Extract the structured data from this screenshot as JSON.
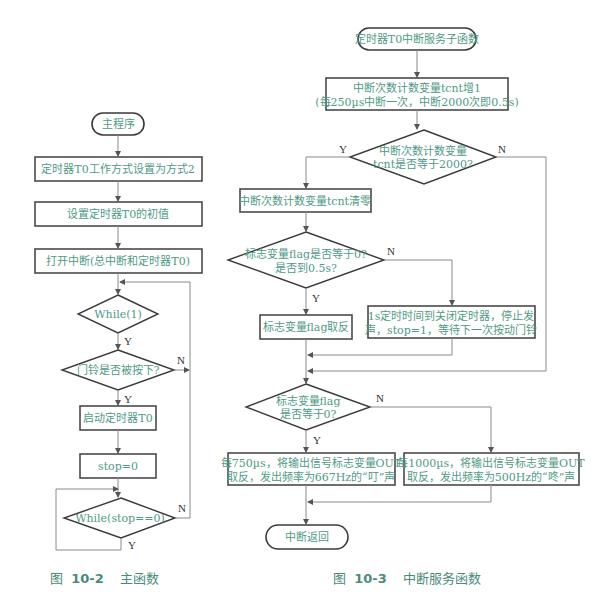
{
  "main_flowchart": {
    "start": "主程序",
    "step1": "定时器T0工作方式设置为方式2",
    "step2": "设置定时器T0的初值",
    "step3": "打开中断(总中断和定时器T0)",
    "decision1": "While(1)",
    "decision2": "门铃是否被按下?",
    "step4": "启动定时器T0",
    "step5": "stop=0",
    "decision3": "While(stop==0)",
    "labels": {
      "yes": "Y",
      "no": "N"
    },
    "caption_prefix": "图",
    "caption_number": "10-2",
    "caption_title": "主函数"
  },
  "isr_flowchart": {
    "start": "定时器T0中断服务子函数",
    "step1_line1": "中断次数计数变量tcnt增1",
    "step1_line2": "(每250µs中断一次，中断2000次即0.5s)",
    "decision1_line1": "中断次数计数变量",
    "decision1_line2": "tcnt是否等于2000?",
    "step2": "中断次数计数变量tcnt清零",
    "decision2_line1": "标志变量flag是否等于0?",
    "decision2_line2": "是否到0.5s?",
    "step3": "标志变量flag取反",
    "step4_line1": "1s定时时间到关闭定时器，停止发",
    "step4_line2": "声，stop=1，等待下一次按动门铃",
    "decision3_line1": "标志变量flag",
    "decision3_line2": "是否等于0?",
    "step5_line1": "每750µs，将输出信号标志变量OUT",
    "step5_line2": "取反，发出频率为667Hz的“叮”声",
    "step6_line1": "每1000µs，将输出信号标志变量OUT",
    "step6_line2": "取反，发出频率为500Hz的“咚”声",
    "end": "中断返回",
    "labels": {
      "yes": "Y",
      "no": "N"
    },
    "caption_prefix": "图",
    "caption_number": "10-3",
    "caption_title": "中断服务函数"
  }
}
